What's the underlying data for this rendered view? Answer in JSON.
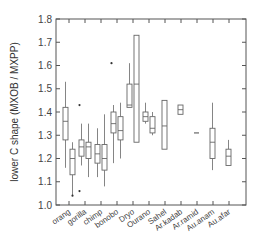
{
  "chart_data": {
    "type": "box",
    "title": "",
    "xlabel": "",
    "ylabel": "lower C shape (MXOB / MXPP)",
    "ylim": [
      1.0,
      1.8
    ],
    "yticks": [
      "1.0",
      "1.1",
      "1.2",
      "1.3",
      "1.4",
      "1.5",
      "1.6",
      "1.7",
      "1.8"
    ],
    "ytick_values": [
      1.0,
      1.1,
      1.2,
      1.3,
      1.4,
      1.5,
      1.6,
      1.7,
      1.8
    ],
    "grid": false,
    "categories": [
      "orang",
      "gorilla",
      "chimp",
      "bonobo",
      "Dryo",
      "Ourano",
      "Sahel",
      "Ar.kadab",
      "Ar.ramid",
      "Au.anam",
      "Au.afar"
    ],
    "groups": [
      {
        "name": "orang",
        "boxes": [
          {
            "whislo": 1.16,
            "q1": 1.28,
            "med": 1.36,
            "q3": 1.42,
            "whishi": 1.53,
            "fliers": []
          },
          {
            "whislo": 1.04,
            "q1": 1.13,
            "med": 1.2,
            "q3": 1.24,
            "whishi": 1.27,
            "fliers": [
              1.04
            ]
          }
        ]
      },
      {
        "name": "gorilla",
        "boxes": [
          {
            "whislo": 1.17,
            "q1": 1.21,
            "med": 1.25,
            "q3": 1.28,
            "whishi": 1.35,
            "fliers": [
              1.06,
              1.43
            ]
          },
          {
            "whislo": 1.12,
            "q1": 1.2,
            "med": 1.25,
            "q3": 1.27,
            "whishi": 1.35,
            "fliers": []
          }
        ]
      },
      {
        "name": "chimp",
        "boxes": [
          {
            "whislo": 1.12,
            "q1": 1.18,
            "med": 1.22,
            "q3": 1.26,
            "whishi": 1.33,
            "fliers": []
          },
          {
            "whislo": 1.08,
            "q1": 1.15,
            "med": 1.2,
            "q3": 1.26,
            "whishi": 1.39,
            "fliers": []
          }
        ]
      },
      {
        "name": "bonobo",
        "boxes": [
          {
            "whislo": 1.18,
            "q1": 1.31,
            "med": 1.35,
            "q3": 1.4,
            "whishi": 1.43,
            "fliers": [
              1.61
            ]
          },
          {
            "whislo": 1.2,
            "q1": 1.28,
            "med": 1.32,
            "q3": 1.38,
            "whishi": 1.44,
            "fliers": []
          }
        ]
      },
      {
        "name": "Dryo",
        "boxes": [
          {
            "whislo": 1.42,
            "q1": 1.42,
            "med": 1.43,
            "q3": 1.52,
            "whishi": 1.61,
            "fliers": []
          },
          {
            "whislo": 1.27,
            "q1": 1.27,
            "med": 1.52,
            "q3": 1.73,
            "whishi": 1.73,
            "fliers": []
          }
        ]
      },
      {
        "name": "Ourano",
        "boxes": [
          {
            "whislo": 1.35,
            "q1": 1.36,
            "med": 1.38,
            "q3": 1.4,
            "whishi": 1.44,
            "fliers": []
          },
          {
            "whislo": 1.3,
            "q1": 1.31,
            "med": 1.33,
            "q3": 1.38,
            "whishi": 1.4,
            "fliers": []
          }
        ]
      },
      {
        "name": "Sahel",
        "boxes": [
          {
            "whislo": 1.24,
            "q1": 1.24,
            "med": 1.34,
            "q3": 1.45,
            "whishi": 1.45,
            "fliers": []
          }
        ]
      },
      {
        "name": "Ar.kadab",
        "boxes": [
          {
            "whislo": 1.39,
            "q1": 1.39,
            "med": 1.41,
            "q3": 1.43,
            "whishi": 1.43,
            "fliers": []
          }
        ]
      },
      {
        "name": "Ar.ramid",
        "boxes": [
          {
            "whislo": 1.31,
            "q1": 1.31,
            "med": 1.31,
            "q3": 1.31,
            "whishi": 1.31,
            "fliers": []
          }
        ]
      },
      {
        "name": "Au.anam",
        "boxes": [
          {
            "whislo": 1.15,
            "q1": 1.2,
            "med": 1.27,
            "q3": 1.33,
            "whishi": 1.44,
            "fliers": []
          }
        ]
      },
      {
        "name": "Au.afar",
        "boxes": [
          {
            "whislo": 1.17,
            "q1": 1.17,
            "med": 1.21,
            "q3": 1.24,
            "whishi": 1.28,
            "fliers": []
          }
        ]
      }
    ],
    "colors": {
      "axis": "#555555",
      "box": "#666666",
      "text": "#444444"
    }
  }
}
